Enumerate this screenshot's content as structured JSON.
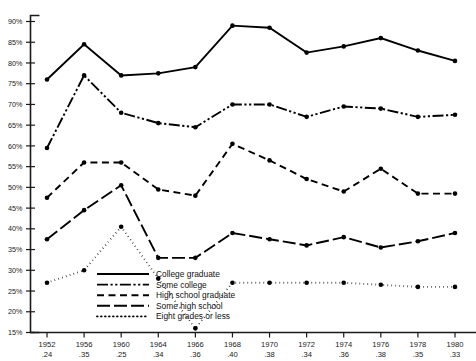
{
  "chart_data": {
    "type": "line",
    "title": "",
    "subtitle": "",
    "xlabel": "",
    "ylabel": "",
    "grid": false,
    "legend_position": "inside-lower-left",
    "ylim": [
      15,
      90
    ],
    "ytick_labels": [
      "90%",
      "85%",
      "80%",
      "75%",
      "70%",
      "65%",
      "60%",
      "55%",
      "50%",
      "45%",
      "40%",
      "35%",
      "30%",
      "25%",
      "20%",
      "15%"
    ],
    "ytick_values": [
      90,
      85,
      80,
      75,
      70,
      65,
      60,
      55,
      50,
      45,
      40,
      35,
      30,
      25,
      20,
      15
    ],
    "categories": [
      "1952",
      "1956",
      "1960",
      "1964",
      "1966",
      "1968",
      "1970",
      "1972",
      "1974",
      "1976",
      "1978",
      "1980"
    ],
    "category_sublabels": [
      ".24",
      ".35",
      ".25",
      ".34",
      ".36",
      ".40",
      ".38",
      ".34",
      ".36",
      ".38",
      ".35",
      ".33"
    ],
    "series": [
      {
        "name": "College graduate",
        "style": "solid",
        "values": [
          76.0,
          84.5,
          77.0,
          77.5,
          79.0,
          89.0,
          88.5,
          82.5,
          84.0,
          86.0,
          83.0,
          80.5
        ]
      },
      {
        "name": "Some college",
        "style": "dash-dot-dot",
        "values": [
          59.5,
          77.0,
          68.0,
          65.5,
          64.5,
          70.0,
          70.0,
          67.0,
          69.5,
          69.0,
          67.0,
          67.5
        ]
      },
      {
        "name": "High school graduate",
        "style": "dashed",
        "values": [
          47.5,
          56.0,
          56.0,
          49.5,
          48.0,
          60.5,
          56.5,
          52.0,
          49.0,
          54.5,
          48.5,
          48.5
        ]
      },
      {
        "name": "Some high school",
        "style": "long-dash",
        "values": [
          37.5,
          44.5,
          50.5,
          33.0,
          33.0,
          39.0,
          37.5,
          36.0,
          38.0,
          35.5,
          37.0,
          39.0
        ]
      },
      {
        "name": "Eight grades or less",
        "style": "dotted",
        "values": [
          27.0,
          30.0,
          40.5,
          28.0,
          16.0,
          27.0,
          27.0,
          27.0,
          27.0,
          26.5,
          26.0,
          26.0
        ]
      }
    ]
  },
  "legend": {
    "items": [
      {
        "label": "College graduate",
        "style": "solid"
      },
      {
        "label": "Some college",
        "style": "dash-dot-dot"
      },
      {
        "label": "High school graduate",
        "style": "dashed"
      },
      {
        "label": "Some high school",
        "style": "long-dash"
      },
      {
        "label": "Eight grades or less",
        "style": "dotted"
      }
    ]
  },
  "colors": {
    "ink": "#000000",
    "background": "#ffffff"
  }
}
